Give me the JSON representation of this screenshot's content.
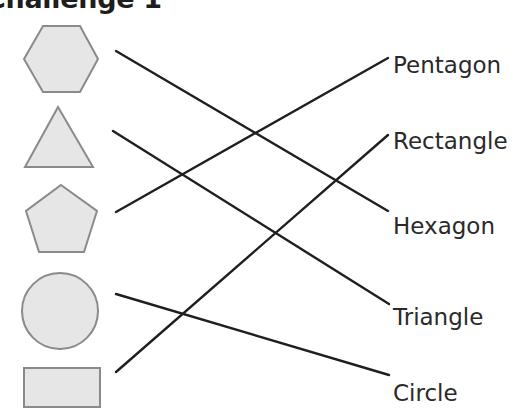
{
  "title": "Challenge 1",
  "shapes": [
    {
      "name": "hexagon",
      "fill": "#e6e6e6",
      "stroke": "#8a8a8a"
    },
    {
      "name": "triangle",
      "fill": "#e6e6e6",
      "stroke": "#8a8a8a"
    },
    {
      "name": "pentagon",
      "fill": "#e6e6e6",
      "stroke": "#8a8a8a"
    },
    {
      "name": "circle",
      "fill": "#e6e6e6",
      "stroke": "#8a8a8a"
    },
    {
      "name": "rectangle",
      "fill": "#e6e6e6",
      "stroke": "#8a8a8a"
    }
  ],
  "labels": [
    "Pentagon",
    "Rectangle",
    "Hexagon",
    "Triangle",
    "Circle"
  ],
  "connections": [
    {
      "from": "hexagon",
      "to": "Hexagon"
    },
    {
      "from": "triangle",
      "to": "Triangle"
    },
    {
      "from": "pentagon",
      "to": "Pentagon"
    },
    {
      "from": "circle",
      "to": "Circle"
    },
    {
      "from": "rectangle",
      "to": "Rectangle"
    }
  ],
  "line_color": "#1f1f1f"
}
